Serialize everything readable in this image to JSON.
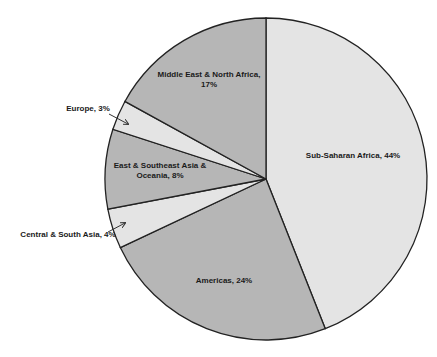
{
  "chart_data": {
    "type": "pie",
    "title": "",
    "start_angle_deg": 0,
    "direction": "clockwise",
    "categories": [
      "Sub-Saharan Africa",
      "Americas",
      "Central & South Asia",
      "East & Southeast Asia & Oceania",
      "Europe",
      "Middle East & North Africa"
    ],
    "values": [
      44,
      24,
      4,
      8,
      3,
      17
    ],
    "unit": "%",
    "colors": [
      "#e4e4e4",
      "#b6b6b6",
      "#e4e4e4",
      "#b6b6b6",
      "#e4e4e4",
      "#b6b6b6"
    ],
    "labels": [
      {
        "lines": [
          "Sub-Saharan Africa, 44%"
        ],
        "x": 353,
        "y": 158,
        "anchor": "middle",
        "leader": false
      },
      {
        "lines": [
          "Americas, 24%"
        ],
        "x": 224,
        "y": 283,
        "anchor": "middle",
        "leader": false
      },
      {
        "lines": [
          "Central & South Asia, 4%"
        ],
        "x": 68,
        "y": 237,
        "anchor": "middle",
        "leader": true,
        "arrow": [
          108,
          232,
          125,
          223
        ]
      },
      {
        "lines": [
          "East & Southeast Asia &",
          "Oceania, 8%"
        ],
        "x": 160,
        "y": 168,
        "anchor": "middle",
        "leader": false
      },
      {
        "lines": [
          "Europe, 3%"
        ],
        "x": 88,
        "y": 111,
        "anchor": "middle",
        "leader": true,
        "arrow": [
          109,
          114,
          128,
          124
        ]
      },
      {
        "lines": [
          "Middle East & North Africa,",
          "17%"
        ],
        "x": 209,
        "y": 77,
        "anchor": "middle",
        "leader": false
      }
    ],
    "legend": "none"
  }
}
